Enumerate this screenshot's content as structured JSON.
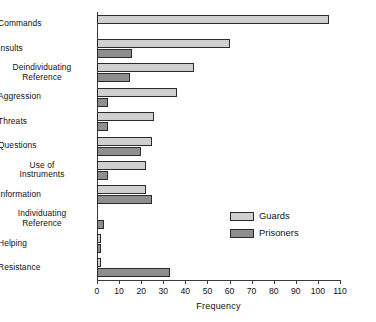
{
  "chart_data": {
    "type": "bar",
    "orientation": "horizontal",
    "title": "",
    "xlabel": "Frequency",
    "ylabel": "",
    "xlim": [
      0,
      110
    ],
    "xticks": [
      0,
      10,
      20,
      30,
      40,
      50,
      60,
      70,
      80,
      90,
      100,
      110
    ],
    "grid": false,
    "legend_position": "center-right",
    "categories": [
      "Commands",
      "Insults",
      "Deindividuating\nReference",
      "Aggression",
      "Threats",
      "Questions",
      "Use of\nInstruments",
      "Information",
      "Individuating\nReference",
      "Helping",
      "Resistance"
    ],
    "series": [
      {
        "name": "Guards",
        "color": "#cfcfcf",
        "values": [
          105,
          60,
          44,
          36,
          26,
          25,
          22,
          22,
          0,
          2,
          2
        ]
      },
      {
        "name": "Prisoners",
        "color": "#8e8e8e",
        "values": [
          0,
          16,
          15,
          5,
          5,
          20,
          5,
          25,
          3,
          2,
          33
        ]
      }
    ]
  },
  "axis": {
    "tick_labels": [
      "0",
      "10",
      "20",
      "30",
      "40",
      "50",
      "60",
      "70",
      "80",
      "90",
      "100",
      "110"
    ],
    "x_title": "Frequency"
  },
  "legend": {
    "entries": [
      {
        "label": "Guards",
        "swatch": "guards"
      },
      {
        "label": "Prisoners",
        "swatch": "prisoners"
      }
    ]
  }
}
